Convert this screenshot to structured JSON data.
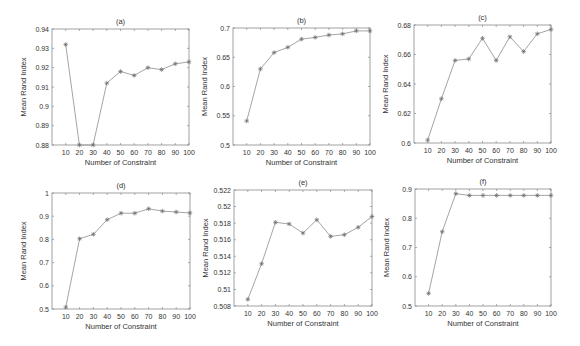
{
  "figure": {
    "line_color": "#9a9a9a",
    "axis_color": "#8a8a8a",
    "marker_color": "#6e6e6e",
    "text_color": "#333333"
  },
  "chart_data": [
    {
      "id": "a",
      "type": "line",
      "title": "(a)",
      "xlabel": "Number of Constraint",
      "ylabel": "Mean Rand Index",
      "x": [
        10,
        20,
        30,
        40,
        50,
        60,
        70,
        80,
        90,
        100
      ],
      "xticks": [
        10,
        20,
        30,
        40,
        50,
        60,
        70,
        80,
        90,
        100
      ],
      "xlim": [
        0,
        100
      ],
      "values": [
        0.932,
        0.88,
        0.88,
        0.912,
        0.918,
        0.916,
        0.92,
        0.919,
        0.922,
        0.923
      ],
      "ylim": [
        0.88,
        0.94
      ],
      "yticks": [
        0.88,
        0.89,
        0.9,
        0.91,
        0.92,
        0.93,
        0.94
      ],
      "yticklabels": [
        "0.88",
        "0.89",
        "0.9",
        "0.91",
        "0.92",
        "0.93",
        "0.94"
      ],
      "grid": false,
      "legend": null,
      "box": {
        "left": 52,
        "top": 29,
        "right": 189,
        "bottom": 145
      }
    },
    {
      "id": "b",
      "type": "line",
      "title": "(b)",
      "xlabel": "Number of Constraint",
      "ylabel": "Mean Rand Index",
      "x": [
        10,
        20,
        30,
        40,
        50,
        60,
        70,
        80,
        90,
        100
      ],
      "xticks": [
        10,
        20,
        30,
        40,
        50,
        60,
        70,
        80,
        90,
        100
      ],
      "xlim": [
        0,
        100
      ],
      "values": [
        0.541,
        0.63,
        0.658,
        0.667,
        0.681,
        0.684,
        0.688,
        0.69,
        0.695,
        0.695
      ],
      "ylim": [
        0.5,
        0.7
      ],
      "yticks": [
        0.5,
        0.55,
        0.6,
        0.65,
        0.7
      ],
      "yticklabels": [
        "0.5",
        "0.55",
        "0.6",
        "0.65",
        "0.7"
      ],
      "grid": false,
      "legend": null,
      "box": {
        "left": 233,
        "top": 28,
        "right": 370,
        "bottom": 145
      }
    },
    {
      "id": "c",
      "type": "line",
      "title": "(c)",
      "xlabel": "Number of Constraint",
      "ylabel": "Mean Rand Index",
      "x": [
        10,
        20,
        30,
        40,
        50,
        60,
        70,
        80,
        90,
        100
      ],
      "xticks": [
        10,
        20,
        30,
        40,
        50,
        60,
        70,
        80,
        90,
        100
      ],
      "xlim": [
        0,
        100
      ],
      "values": [
        0.602,
        0.63,
        0.656,
        0.657,
        0.671,
        0.656,
        0.672,
        0.662,
        0.674,
        0.677
      ],
      "ylim": [
        0.6,
        0.68
      ],
      "yticks": [
        0.6,
        0.62,
        0.64,
        0.66,
        0.68
      ],
      "yticklabels": [
        "0.6",
        "0.62",
        "0.64",
        "0.66",
        "0.68"
      ],
      "grid": false,
      "legend": null,
      "box": {
        "left": 414,
        "top": 25,
        "right": 551,
        "bottom": 143
      }
    },
    {
      "id": "d",
      "type": "line",
      "title": "(d)",
      "xlabel": "Number of Constraint",
      "ylabel": "Mean Rand Index",
      "x": [
        10,
        20,
        30,
        40,
        50,
        60,
        70,
        80,
        90,
        100
      ],
      "xticks": [
        10,
        20,
        30,
        40,
        50,
        60,
        70,
        80,
        90,
        100
      ],
      "xlim": [
        0,
        100
      ],
      "values": [
        0.508,
        0.803,
        0.822,
        0.885,
        0.913,
        0.913,
        0.932,
        0.922,
        0.918,
        0.914
      ],
      "ylim": [
        0.5,
        1.0
      ],
      "yticks": [
        0.5,
        0.6,
        0.7,
        0.8,
        0.9,
        1.0
      ],
      "yticklabels": [
        "0.5",
        "0.6",
        "0.7",
        "0.8",
        "0.9",
        "1"
      ],
      "grid": false,
      "legend": null,
      "box": {
        "left": 52,
        "top": 193,
        "right": 190,
        "bottom": 309
      }
    },
    {
      "id": "e",
      "type": "line",
      "title": "(e)",
      "xlabel": "Number of Constraint",
      "ylabel": "Mean Rand Index",
      "x": [
        10,
        20,
        30,
        40,
        50,
        60,
        70,
        80,
        90,
        100
      ],
      "xticks": [
        10,
        20,
        30,
        40,
        50,
        60,
        70,
        80,
        90,
        100
      ],
      "xlim": [
        0,
        100
      ],
      "values": [
        0.5088,
        0.5131,
        0.5181,
        0.5179,
        0.5168,
        0.5184,
        0.5164,
        0.5166,
        0.5175,
        0.5188
      ],
      "ylim": [
        0.508,
        0.522
      ],
      "yticks": [
        0.508,
        0.51,
        0.512,
        0.514,
        0.516,
        0.518,
        0.52,
        0.522
      ],
      "yticklabels": [
        "0.508",
        "0.51",
        "0.512",
        "0.514",
        "0.516",
        "0.518",
        "0.52",
        "0.522"
      ],
      "grid": false,
      "legend": null,
      "box": {
        "left": 234,
        "top": 190,
        "right": 372,
        "bottom": 306
      }
    },
    {
      "id": "f",
      "type": "line",
      "title": "(f)",
      "xlabel": "Number of Constraint",
      "ylabel": "Mean Rand Index",
      "x": [
        10,
        20,
        30,
        40,
        50,
        60,
        70,
        80,
        90,
        100
      ],
      "xticks": [
        10,
        20,
        30,
        40,
        50,
        60,
        70,
        80,
        90,
        100
      ],
      "xlim": [
        0,
        100
      ],
      "values": [
        0.543,
        0.754,
        0.884,
        0.878,
        0.878,
        0.878,
        0.878,
        0.878,
        0.878,
        0.878
      ],
      "ylim": [
        0.5,
        0.9
      ],
      "yticks": [
        0.5,
        0.6,
        0.7,
        0.8,
        0.9
      ],
      "yticklabels": [
        "0.5",
        "0.6",
        "0.7",
        "0.8",
        "0.9"
      ],
      "grid": false,
      "legend": null,
      "box": {
        "left": 415,
        "top": 189,
        "right": 551,
        "bottom": 306
      }
    }
  ]
}
